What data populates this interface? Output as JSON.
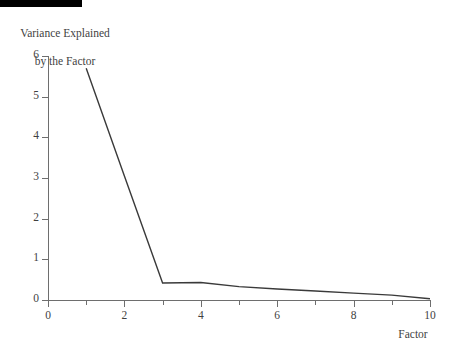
{
  "decoration": {
    "top_rule_color": "#000000"
  },
  "chart_data": {
    "type": "line",
    "title": "",
    "ylabel_line1": "Variance Explained",
    "ylabel_line2": "by the Factor",
    "xlabel": "Factor",
    "x": [
      1,
      2,
      3,
      4,
      5,
      6,
      7,
      8,
      9,
      10
    ],
    "values": [
      5.7,
      3.05,
      0.42,
      0.43,
      0.33,
      0.27,
      0.22,
      0.17,
      0.12,
      0.03
    ],
    "series": [
      {
        "name": "Variance Explained by the Factor",
        "values": [
          5.7,
          3.05,
          0.42,
          0.43,
          0.33,
          0.27,
          0.22,
          0.17,
          0.12,
          0.03
        ]
      }
    ],
    "xlim": [
      0,
      10
    ],
    "ylim": [
      0,
      6
    ],
    "xticks_major": [
      0,
      2,
      4,
      6,
      8,
      10
    ],
    "xticks_minor": [
      1,
      3,
      5,
      7,
      9
    ],
    "xtick_labels": [
      "0",
      "2",
      "4",
      "6",
      "8",
      "10"
    ],
    "yticks_major": [
      0,
      1,
      2,
      3,
      4,
      5,
      6
    ],
    "ytick_labels": [
      "0",
      "1",
      "2",
      "3",
      "4",
      "5",
      "6"
    ],
    "grid": false,
    "legend": "none",
    "line_color": "#3a3a3a",
    "axis_color": "#6e6e6e",
    "text_color": "#3f3f3f",
    "annotations": []
  },
  "yaxis": {
    "ticks": [
      {
        "label": "6",
        "value": 6
      },
      {
        "label": "5",
        "value": 5
      },
      {
        "label": "4",
        "value": 4
      },
      {
        "label": "3",
        "value": 3
      },
      {
        "label": "2",
        "value": 2
      },
      {
        "label": "1",
        "value": 1
      },
      {
        "label": "0",
        "value": 0
      }
    ]
  },
  "xaxis": {
    "ticks": [
      {
        "label": "0",
        "value": 0
      },
      {
        "label": "2",
        "value": 2
      },
      {
        "label": "4",
        "value": 4
      },
      {
        "label": "6",
        "value": 6
      },
      {
        "label": "8",
        "value": 8
      },
      {
        "label": "10",
        "value": 10
      }
    ],
    "caption": "Factor"
  }
}
